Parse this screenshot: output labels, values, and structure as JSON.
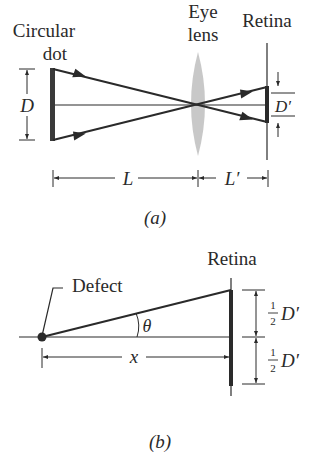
{
  "panel_a": {
    "caption": "(a)",
    "labels": {
      "object_line1": "Circular",
      "object_line2": "dot",
      "lens_line1": "Eye",
      "lens_line2": "lens",
      "retina": "Retina"
    },
    "dimensions": {
      "object_size": "D",
      "image_size": "D′",
      "object_distance": "L",
      "image_distance": "L′"
    }
  },
  "panel_b": {
    "caption": "(b)",
    "labels": {
      "retina": "Retina",
      "defect": "Defect",
      "angle": "θ",
      "distance": "x",
      "half_num": "1",
      "half_den": "2",
      "half_var": "D′"
    }
  },
  "colors": {
    "ink": "#2a2a2a",
    "lens": "#c8c8c8",
    "background": "#ffffff"
  }
}
